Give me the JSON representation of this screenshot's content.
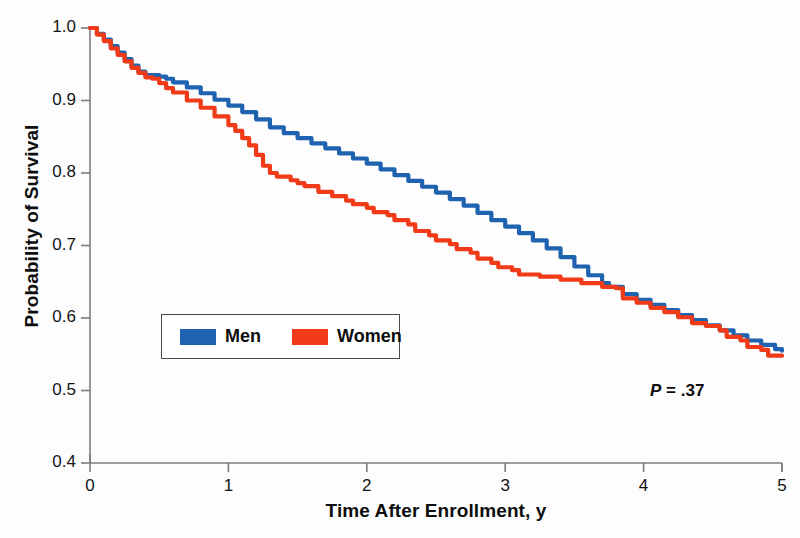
{
  "axes": {
    "ylabel": "Probability of Survival",
    "xlabel": "Time After Enrollment, y",
    "yticks": [
      "1.0",
      "0.9",
      "0.8",
      "0.7",
      "0.6",
      "0.5",
      "0.4"
    ],
    "xticks": [
      "0",
      "1",
      "2",
      "3",
      "4",
      "5"
    ]
  },
  "legend": {
    "men_label": "Men",
    "women_label": "Women"
  },
  "annotation": {
    "p_symbol": "P",
    "p_text": " = .37"
  },
  "colors": {
    "men": "#1f63b0",
    "women": "#f03a18",
    "axis": "#7d7d7d",
    "text": "#111111",
    "legend_border": "#4a4a4a",
    "background": "#fdfdfd"
  },
  "chart_data": {
    "type": "line",
    "title": "",
    "subtitle": "",
    "xlabel": "Time After Enrollment, y",
    "ylabel": "Probability of Survival",
    "xlim": [
      0,
      5
    ],
    "ylim": [
      0.4,
      1.0
    ],
    "xticks": [
      0,
      1,
      2,
      3,
      4,
      5
    ],
    "yticks": [
      0.4,
      0.5,
      0.6,
      0.7,
      0.8,
      0.9,
      1.0
    ],
    "grid": false,
    "legend_position": "center-left-inside",
    "annotations": [
      {
        "text": "P = .37",
        "x": 4.1,
        "y": 0.475,
        "italic_prefix": "P"
      }
    ],
    "curve_style": "kaplan-meier step",
    "series": [
      {
        "name": "Men",
        "color": "#1f63b0",
        "points": [
          [
            0.0,
            1.0
          ],
          [
            0.05,
            0.992
          ],
          [
            0.1,
            0.984
          ],
          [
            0.15,
            0.975
          ],
          [
            0.2,
            0.966
          ],
          [
            0.25,
            0.957
          ],
          [
            0.3,
            0.948
          ],
          [
            0.35,
            0.94
          ],
          [
            0.4,
            0.935
          ],
          [
            0.5,
            0.933
          ],
          [
            0.55,
            0.93
          ],
          [
            0.6,
            0.925
          ],
          [
            0.7,
            0.918
          ],
          [
            0.8,
            0.91
          ],
          [
            0.9,
            0.901
          ],
          [
            1.0,
            0.893
          ],
          [
            1.1,
            0.884
          ],
          [
            1.2,
            0.874
          ],
          [
            1.3,
            0.863
          ],
          [
            1.4,
            0.855
          ],
          [
            1.5,
            0.848
          ],
          [
            1.6,
            0.841
          ],
          [
            1.7,
            0.834
          ],
          [
            1.8,
            0.827
          ],
          [
            1.9,
            0.82
          ],
          [
            2.0,
            0.813
          ],
          [
            2.1,
            0.805
          ],
          [
            2.2,
            0.797
          ],
          [
            2.3,
            0.789
          ],
          [
            2.4,
            0.781
          ],
          [
            2.5,
            0.773
          ],
          [
            2.6,
            0.764
          ],
          [
            2.7,
            0.755
          ],
          [
            2.8,
            0.745
          ],
          [
            2.9,
            0.735
          ],
          [
            3.0,
            0.726
          ],
          [
            3.1,
            0.717
          ],
          [
            3.2,
            0.707
          ],
          [
            3.3,
            0.696
          ],
          [
            3.4,
            0.684
          ],
          [
            3.5,
            0.671
          ],
          [
            3.6,
            0.659
          ],
          [
            3.7,
            0.648
          ],
          [
            3.75,
            0.643
          ],
          [
            3.85,
            0.633
          ],
          [
            3.95,
            0.625
          ],
          [
            4.05,
            0.618
          ],
          [
            4.15,
            0.611
          ],
          [
            4.25,
            0.604
          ],
          [
            4.35,
            0.597
          ],
          [
            4.45,
            0.59
          ],
          [
            4.55,
            0.583
          ],
          [
            4.65,
            0.576
          ],
          [
            4.75,
            0.569
          ],
          [
            4.85,
            0.563
          ],
          [
            4.95,
            0.557
          ],
          [
            5.0,
            0.555
          ]
        ]
      },
      {
        "name": "Women",
        "color": "#f03a18",
        "points": [
          [
            0.0,
            1.0
          ],
          [
            0.05,
            0.991
          ],
          [
            0.1,
            0.982
          ],
          [
            0.15,
            0.972
          ],
          [
            0.2,
            0.963
          ],
          [
            0.25,
            0.954
          ],
          [
            0.3,
            0.945
          ],
          [
            0.35,
            0.938
          ],
          [
            0.4,
            0.932
          ],
          [
            0.45,
            0.93
          ],
          [
            0.5,
            0.924
          ],
          [
            0.55,
            0.917
          ],
          [
            0.6,
            0.911
          ],
          [
            0.7,
            0.9
          ],
          [
            0.8,
            0.89
          ],
          [
            0.9,
            0.878
          ],
          [
            1.0,
            0.866
          ],
          [
            1.05,
            0.858
          ],
          [
            1.1,
            0.848
          ],
          [
            1.15,
            0.838
          ],
          [
            1.2,
            0.825
          ],
          [
            1.25,
            0.81
          ],
          [
            1.3,
            0.8
          ],
          [
            1.35,
            0.795
          ],
          [
            1.45,
            0.79
          ],
          [
            1.5,
            0.786
          ],
          [
            1.55,
            0.782
          ],
          [
            1.65,
            0.774
          ],
          [
            1.75,
            0.768
          ],
          [
            1.85,
            0.762
          ],
          [
            1.9,
            0.757
          ],
          [
            2.0,
            0.752
          ],
          [
            2.05,
            0.746
          ],
          [
            2.15,
            0.742
          ],
          [
            2.2,
            0.735
          ],
          [
            2.3,
            0.729
          ],
          [
            2.35,
            0.72
          ],
          [
            2.45,
            0.714
          ],
          [
            2.5,
            0.707
          ],
          [
            2.6,
            0.702
          ],
          [
            2.65,
            0.695
          ],
          [
            2.75,
            0.69
          ],
          [
            2.8,
            0.682
          ],
          [
            2.9,
            0.676
          ],
          [
            2.95,
            0.67
          ],
          [
            3.05,
            0.666
          ],
          [
            3.1,
            0.66
          ],
          [
            3.25,
            0.657
          ],
          [
            3.4,
            0.653
          ],
          [
            3.55,
            0.648
          ],
          [
            3.7,
            0.643
          ],
          [
            3.8,
            0.641
          ],
          [
            3.85,
            0.627
          ],
          [
            3.95,
            0.621
          ],
          [
            4.05,
            0.614
          ],
          [
            4.15,
            0.608
          ],
          [
            4.25,
            0.601
          ],
          [
            4.35,
            0.593
          ],
          [
            4.45,
            0.589
          ],
          [
            4.55,
            0.583
          ],
          [
            4.6,
            0.574
          ],
          [
            4.7,
            0.569
          ],
          [
            4.75,
            0.56
          ],
          [
            4.85,
            0.556
          ],
          [
            4.9,
            0.548
          ],
          [
            5.0,
            0.548
          ]
        ]
      }
    ]
  }
}
